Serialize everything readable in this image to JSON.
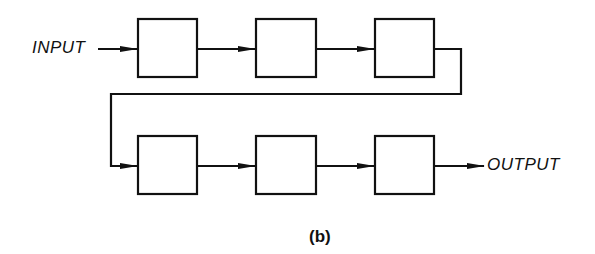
{
  "diagram": {
    "input_label": "INPUT",
    "output_label": "OUTPUT",
    "caption": "(b)",
    "rows": [
      {
        "blocks": [
          "",
          "",
          ""
        ]
      },
      {
        "blocks": [
          "",
          "",
          ""
        ]
      }
    ],
    "line_color": "#111111",
    "background": "#ffffff"
  }
}
